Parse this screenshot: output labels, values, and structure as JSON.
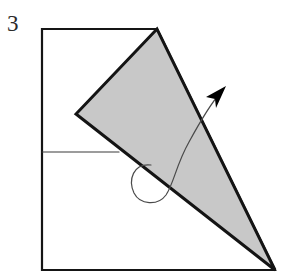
{
  "canvas": {
    "width": 287,
    "height": 280,
    "background_color": "#ffffff"
  },
  "label": {
    "text": "3",
    "color": "#2b2b2b",
    "x": 7,
    "y": 31,
    "font_size": 23
  },
  "chart_data": {
    "type": "diagram",
    "title": "3",
    "shapes": [
      {
        "name": "outline-quadrilateral",
        "kind": "polygon",
        "points": [
          [
            42,
            29
          ],
          [
            157,
            29
          ],
          [
            275,
            270
          ],
          [
            42,
            270
          ]
        ],
        "fill": "none",
        "stroke": "#151515",
        "stroke_width": 2.2,
        "closed": true
      },
      {
        "name": "interior-horizontal-line",
        "kind": "polyline",
        "points": [
          [
            42,
            152
          ],
          [
            119,
            152
          ]
        ],
        "fill": "none",
        "stroke": "#3a3a3a",
        "stroke_width": 1.1,
        "closed": false
      },
      {
        "name": "shaded-triangle",
        "kind": "polygon",
        "points": [
          [
            157,
            29
          ],
          [
            76,
            114
          ],
          [
            275,
            270
          ]
        ],
        "fill": "#c8c8c8",
        "stroke": "#141414",
        "stroke_width": 3.0,
        "closed": true
      }
    ],
    "arrow": {
      "name": "curved-rotation-arrow",
      "path": "M 151 165 C 133 163 128 180 134 193 C 140 205 158 206 166 195 C 174 183 176 165 189 142 C 201 120 213 101 221 92",
      "stroke": "#4a4a4a",
      "stroke_width": 1.2,
      "fill": "none",
      "head": {
        "name": "arrowhead",
        "points": [
          [
            226,
            86
          ],
          [
            206,
            97
          ],
          [
            215,
            99
          ],
          [
            216,
            108
          ]
        ],
        "fill": "#000000",
        "tip": [
          226,
          86
        ]
      }
    },
    "colors": {
      "background": "#ffffff",
      "shade_fill": "#c8c8c8",
      "outline_stroke": "#151515",
      "triangle_stroke": "#141414",
      "thin_line": "#3a3a3a",
      "arrow_stroke": "#4a4a4a",
      "arrowhead_fill": "#000000",
      "label": "#2b2b2b"
    }
  }
}
